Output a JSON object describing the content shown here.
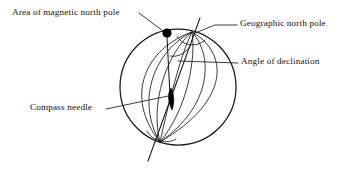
{
  "figure": {
    "background_color": "#ffffff",
    "ink_color": "#1a1a1a",
    "width": 349,
    "height": 174
  },
  "labels": {
    "magnetic_pole": "Area of magnetic north pole",
    "geographic_pole": "Geographic north pole",
    "declination": "Angle of declination",
    "compass_needle": "Compass needle"
  },
  "diagram": {
    "sphere": {
      "center_x": 178,
      "center_y": 87,
      "radius": 58,
      "stroke": "#1a1a1a",
      "stroke_width": 1.1
    },
    "rotation_axis": {
      "x1": 200,
      "y1": 18,
      "x2": 148,
      "y2": 161,
      "stroke": "#1a1a1a"
    },
    "geographic_north_pole_point": {
      "x": 192,
      "y": 32
    },
    "geographic_south_pole_point": {
      "x": 160,
      "y": 142
    },
    "magnetic_north_pole_dot": {
      "x": 167,
      "y": 33,
      "radius": 4.6,
      "fill": "#000000"
    },
    "magnetic_axis_line": {
      "x1": 167,
      "y1": 36,
      "x2": 170,
      "y2": 96
    },
    "compass_needle_shape": {
      "x": 170,
      "y": 98,
      "length": 22,
      "width": 5,
      "fill": "#000000"
    },
    "declination_arc": {
      "cx": 186,
      "cy": 34,
      "radius": 16
    },
    "meridian_count": 7,
    "equator_visible": false
  },
  "leader_lines": {
    "magnetic_pole": {
      "x1": 140,
      "y1": 14,
      "x2": 163,
      "y2": 31
    },
    "geographic_pole": {
      "x1": 237,
      "y1": 25,
      "x2": 216,
      "y2": 25,
      "x3": 194,
      "y3": 33
    },
    "declination": {
      "x1": 238,
      "y1": 63,
      "x2": 179,
      "y2": 61
    },
    "compass_needle": {
      "x1": 107,
      "y1": 109,
      "x2": 173,
      "y2": 95
    }
  }
}
